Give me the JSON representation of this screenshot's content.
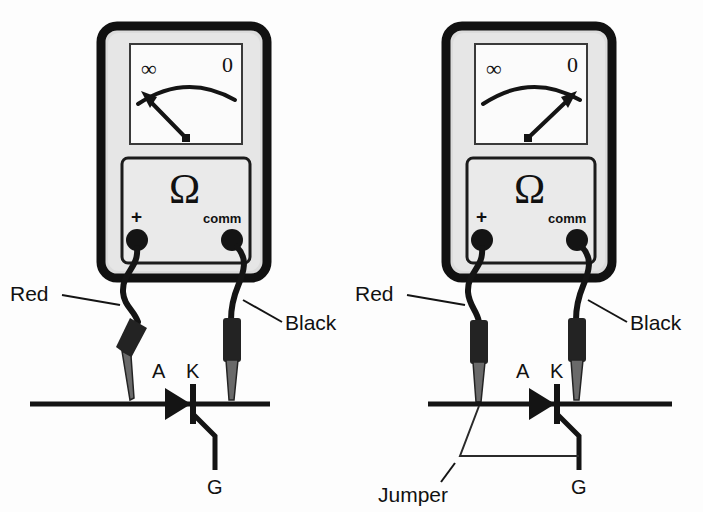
{
  "figure": {
    "background_color": "#fdfdfd",
    "ink_color": "#141414"
  },
  "panels": [
    {
      "id": "left",
      "caption": "SCR blocking test without gate trigger",
      "meter": {
        "scale": {
          "left_label": "∞",
          "right_label": "0",
          "needle_points_to": "∞",
          "needle_angle_deg": -38
        },
        "function_symbol": "Ω",
        "terminals": [
          {
            "name": "positive",
            "label": "+"
          },
          {
            "name": "common",
            "label": "comm"
          }
        ]
      },
      "probes": [
        {
          "name": "red-probe",
          "label": "Red",
          "connects_to": "A"
        },
        {
          "name": "black-probe",
          "label": "Black",
          "connects_to": "K"
        }
      ],
      "scr": {
        "anode_label": "A",
        "cathode_label": "K",
        "gate_label": "G"
      },
      "jumper": null
    },
    {
      "id": "right",
      "caption": "SCR latched test with gate jumper",
      "meter": {
        "scale": {
          "left_label": "∞",
          "right_label": "0",
          "needle_points_to": "0",
          "needle_angle_deg": 38
        },
        "function_symbol": "Ω",
        "terminals": [
          {
            "name": "positive",
            "label": "+"
          },
          {
            "name": "common",
            "label": "comm"
          }
        ]
      },
      "probes": [
        {
          "name": "red-probe",
          "label": "Red",
          "connects_to": "A"
        },
        {
          "name": "black-probe",
          "label": "Black",
          "connects_to": "K"
        }
      ],
      "scr": {
        "anode_label": "A",
        "cathode_label": "K",
        "gate_label": "G"
      },
      "jumper": {
        "label": "Jumper",
        "connects": "A to G"
      }
    }
  ]
}
